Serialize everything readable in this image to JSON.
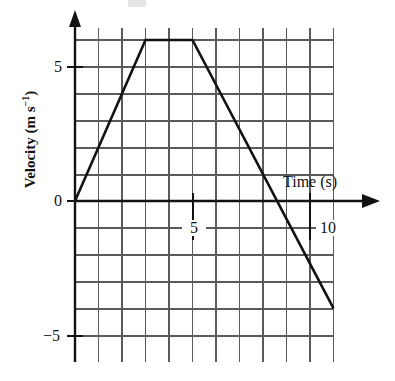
{
  "figure": {
    "kind": "velocity-time-graph",
    "background": "#ffffff",
    "ink": "#121212",
    "grid_color": "#5a5a5a"
  },
  "labels": {
    "y_axis_title": "Velocity (m s",
    "y_axis_title_exp": "−1",
    "y_axis_title_tail": ")",
    "x_axis_title": "Time (s)"
  },
  "ticks": {
    "y": [
      {
        "value": 5,
        "label": "5"
      },
      {
        "value": 0,
        "label": "0"
      },
      {
        "value": -5,
        "label": "−5"
      }
    ],
    "x": [
      {
        "value": 5,
        "label": "5"
      },
      {
        "value": 10,
        "label": "10"
      }
    ]
  },
  "chart_data": {
    "type": "line",
    "title": "",
    "xlabel": "Time (s)",
    "ylabel": "Velocity (m s^-1)",
    "xlim": [
      0,
      11
    ],
    "ylim": [
      -5,
      6
    ],
    "grid": true,
    "legend": null,
    "x_major_step": 5,
    "x_grid_step": 1,
    "y_major_step": 5,
    "y_grid_step": 1,
    "axis_arrows": [
      "x-positive",
      "y-positive"
    ],
    "series": [
      {
        "name": "velocity",
        "color": "#121212",
        "x": [
          0,
          3,
          5,
          11
        ],
        "y": [
          0,
          6,
          6,
          -4
        ],
        "points": [
          {
            "t": 0,
            "v": 0,
            "note": "start at rest"
          },
          {
            "t": 3,
            "v": 6,
            "note": "end of acceleration"
          },
          {
            "t": 5,
            "v": 6,
            "note": "end of constant velocity"
          },
          {
            "t": 11,
            "v": -4,
            "note": "final velocity"
          }
        ],
        "zero_crossing_t": 8
      }
    ]
  }
}
